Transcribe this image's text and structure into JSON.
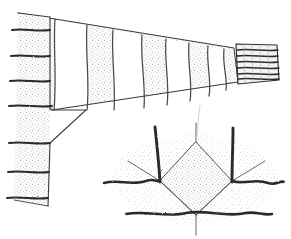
{
  "figure": {
    "medium": "hand-drawn pen-and-ink line illustration with stipple shading",
    "background_color": "#ffffff",
    "ink_color": "#2b2b2b",
    "stipple_color": "#b9b9b9",
    "canvas": {
      "width": 291,
      "height": 239
    }
  },
  "parts": [
    {
      "name": "sleeve-body",
      "label": "Tapered striped sleeve",
      "description": "Wide at the left shoulder edge, narrowing to the right toward the cuff"
    },
    {
      "name": "side-band",
      "label": "Left side band with rungs",
      "description": "Vertical band at far left crossed by horizontal rung lines"
    },
    {
      "name": "cuff",
      "label": "Ribbed cuff",
      "description": "Small rectangle at right end filled with horizontal ribbing lines"
    },
    {
      "name": "needle-detail",
      "label": "Needle decrease detail",
      "description": "Lower diagram: diamond of fabric with two needles and wavy yarn rows"
    }
  ],
  "sleeve": {
    "stripe_count": 6,
    "stripe_fill": "stipple",
    "gap_fill": "white",
    "outline_color": "#333333"
  },
  "side_band": {
    "rung_count": 7,
    "rung_color": "#2b2b2b"
  },
  "cuff": {
    "rib_line_count": 6,
    "rib_color": "#2b2b2b"
  },
  "needle_detail": {
    "needle_count": 2,
    "wavy_row_count": 3,
    "diamond_fill": "stipple",
    "spoke_count": 6
  },
  "colors": {
    "ink": "#2b2b2b",
    "light_ink": "#555555",
    "stipple": "#b9b9b9",
    "paper": "#ffffff"
  }
}
